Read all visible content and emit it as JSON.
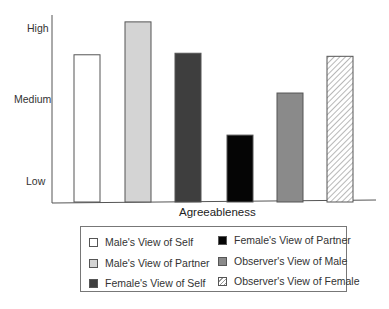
{
  "chart_data": {
    "type": "bar",
    "title": "",
    "xlabel": "Agreeableness",
    "ylabel": "",
    "y_ticks": [
      {
        "label": "Low",
        "value": 1
      },
      {
        "label": "Medium",
        "value": 2
      },
      {
        "label": "High",
        "value": 3
      }
    ],
    "ylim": [
      0.73,
      3.3
    ],
    "grid": false,
    "legend_position": "bottom",
    "categories": [
      "Agreeableness"
    ],
    "series": [
      {
        "name": "Male's View of Self",
        "values": [
          2.65
        ],
        "fill": "#ffffff",
        "pattern": "none"
      },
      {
        "name": "Male's View of Partner",
        "values": [
          3.08
        ],
        "fill": "#d4d4d4",
        "pattern": "none"
      },
      {
        "name": "Female's View of Self",
        "values": [
          2.67
        ],
        "fill": "#3e3e3e",
        "pattern": "none"
      },
      {
        "name": "Female's View of Partner",
        "values": [
          1.6
        ],
        "fill": "#050505",
        "pattern": "none"
      },
      {
        "name": "Observer's View of Male",
        "values": [
          2.15
        ],
        "fill": "#8a8a8a",
        "pattern": "none"
      },
      {
        "name": "Observer's View of Female",
        "values": [
          2.63
        ],
        "fill": "#ffffff",
        "pattern": "diagonal-hatch"
      }
    ]
  },
  "legend": {
    "items": [
      "Male's View of Self",
      "Male's View of Partner",
      "Female's View of Self",
      "Female's View of Partner",
      "Observer's View of Male",
      "Observer's View of Female"
    ]
  }
}
